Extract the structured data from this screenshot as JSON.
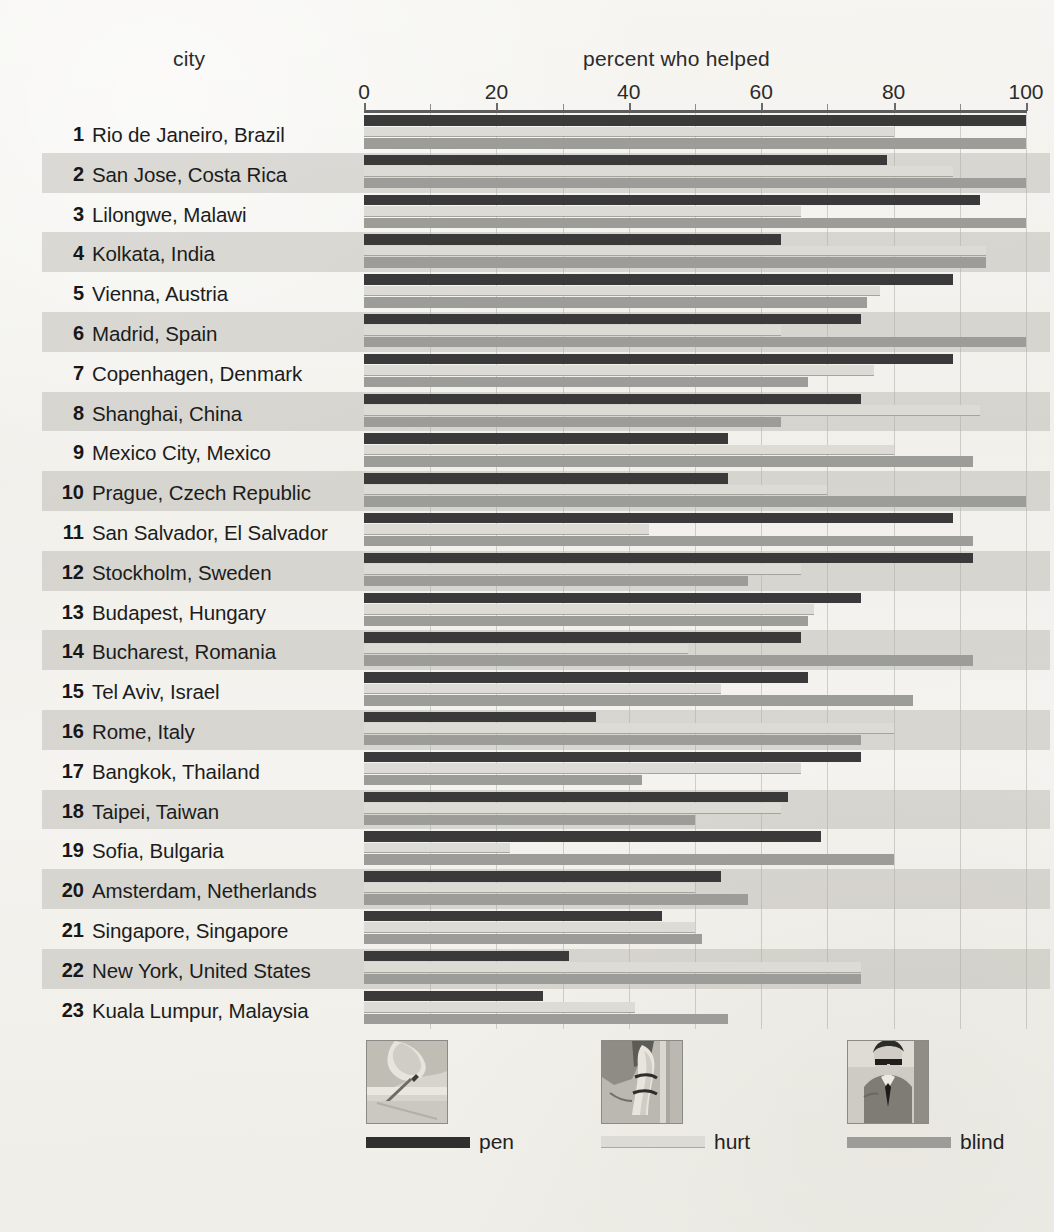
{
  "header": {
    "city_label": "city",
    "value_label": "percent who helped"
  },
  "axis": {
    "ticks": [
      0,
      20,
      40,
      60,
      80,
      100
    ],
    "minor_ticks": [
      10,
      30,
      50,
      70,
      90
    ],
    "min": 0,
    "max": 100
  },
  "legend": {
    "items": [
      {
        "label": "pen",
        "swatch": "pen-swatch",
        "color": "#2f2f2f",
        "thumb_name": "dropped-pen-photo"
      },
      {
        "label": "hurt",
        "swatch": "hurt-swatch",
        "color": "#dcdbd5",
        "thumb_name": "hurt-leg-photo"
      },
      {
        "label": "blind",
        "swatch": "blind-swatch",
        "color": "#9c9c98",
        "thumb_name": "blind-man-photo"
      }
    ]
  },
  "colors": {
    "pen": "#3a3a3a",
    "hurt": "#dcdbd5",
    "blind": "#9c9c98",
    "background": "#f3f2ee",
    "band": "#b0afa8"
  },
  "chart_data": {
    "type": "bar",
    "orientation": "horizontal",
    "title": "percent who helped",
    "xlabel": "percent who helped",
    "ylabel": "city",
    "xlim": [
      0,
      100
    ],
    "grid": true,
    "legend_position": "bottom",
    "categories": [
      "Rio de Janeiro, Brazil",
      "San Jose, Costa Rica",
      "Lilongwe, Malawi",
      "Kolkata, India",
      "Vienna, Austria",
      "Madrid, Spain",
      "Copenhagen, Denmark",
      "Shanghai, China",
      "Mexico City, Mexico",
      "Prague, Czech Republic",
      "San Salvador, El Salvador",
      "Stockholm, Sweden",
      "Budapest, Hungary",
      "Bucharest, Romania",
      "Tel Aviv, Israel",
      "Rome, Italy",
      "Bangkok, Thailand",
      "Taipei, Taiwan",
      "Sofia, Bulgaria",
      "Amsterdam, Netherlands",
      "Singapore, Singapore",
      "New York, United States",
      "Kuala Lumpur, Malaysia"
    ],
    "ranks": [
      1,
      2,
      3,
      4,
      5,
      6,
      7,
      8,
      9,
      10,
      11,
      12,
      13,
      14,
      15,
      16,
      17,
      18,
      19,
      20,
      21,
      22,
      23
    ],
    "series": [
      {
        "name": "pen",
        "color": "#3a3a3a",
        "values": [
          100,
          79,
          93,
          63,
          89,
          75,
          89,
          75,
          55,
          55,
          89,
          92,
          75,
          66,
          67,
          35,
          75,
          64,
          69,
          54,
          45,
          31,
          27
        ]
      },
      {
        "name": "hurt",
        "color": "#dcdbd5",
        "values": [
          80,
          89,
          66,
          94,
          78,
          63,
          77,
          93,
          80,
          70,
          43,
          66,
          68,
          49,
          54,
          80,
          66,
          63,
          22,
          50,
          50,
          75,
          41
        ]
      },
      {
        "name": "blind",
        "color": "#9c9c98",
        "values": [
          100,
          100,
          100,
          94,
          76,
          100,
          67,
          63,
          92,
          100,
          92,
          58,
          67,
          92,
          83,
          75,
          42,
          50,
          80,
          58,
          51,
          75,
          55
        ]
      }
    ]
  }
}
